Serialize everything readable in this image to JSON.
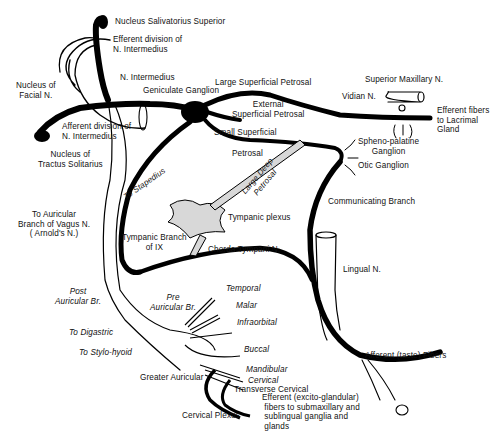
{
  "diagram": {
    "colors": {
      "nerve": "#000000",
      "plexus_fill": "#d8d8d8",
      "background": "#ffffff"
    },
    "labels": {
      "nucleus_salivatorius": "Nucleus Salivatorius Superior",
      "efferent_division": "Efferent division of\nN. Intermedius",
      "nucleus_facial": "Nucleus of\nFacial N.",
      "n_intermedius": "N. Intermedius",
      "geniculate_ganglion": "Geniculate Ganglion",
      "large_superficial_petrosal": "Large Superficial Petrosal",
      "superior_maxillary": "Superior Maxillary N.",
      "vidian": "Vidian N.",
      "efferent_lacrimal": "Efferent fibers\nto Lacrimal\nGland",
      "external_superficial_petrosal": "External\nSuperficial Petrosal",
      "afferent_division": "Afferent division of\nN. Intermedius",
      "nucleus_tractus": "Nucleus of\nTractus Solitarius",
      "small_superficial": "Small Superficial",
      "petrosal": "Petrosal",
      "spheno_palatine": "Spheno-palatine\nGanglion",
      "otic_ganglion": "Otic Ganglion",
      "to_stapedius": "To Stapedius",
      "large_deep_petrosal": "Large Deep\nPetrosal",
      "to_auricular_vagus": "To Auricular\nBranch of Vagus N.\n( Arnold's N.)",
      "tympanic_plexus": "Tympanic plexus",
      "communicating_branch": "Communicating Branch",
      "tympanic_branch_ix": "Tympanic Branch\nof IX",
      "chorda_tympani": "Chorda Tympani N.",
      "lingual": "Lingual N.",
      "post_auricular": "Post\nAuricular Br.",
      "pre_auricular": "Pre\nAuricular Br.",
      "temporal": "Temporal",
      "malar": "Malar",
      "infraorbital": "Infraorbital",
      "to_digastric": "To Digastric",
      "to_stylohyoid": "To Stylo-hyoid",
      "buccal": "Buccal",
      "mandibular": "Mandibular",
      "cervical": "Cervical",
      "greater_auricular": "Greater Auricular",
      "transverse_cervical": "Transverse Cervical",
      "afferent_taste": "Afferent (taste) Fibers",
      "efferent_excito": "Efferent (excito-glandular)\n fibers to submaxillary and\n sublingual ganglia and\n glands",
      "cervical_plexus": "Cervical Plexus"
    }
  }
}
